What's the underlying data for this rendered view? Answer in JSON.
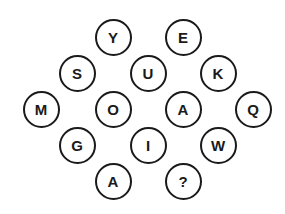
{
  "puzzle": {
    "cells": [
      {
        "label": "Y",
        "x": 113,
        "y": 37
      },
      {
        "label": "E",
        "x": 183,
        "y": 37
      },
      {
        "label": "S",
        "x": 77,
        "y": 73
      },
      {
        "label": "U",
        "x": 148,
        "y": 73
      },
      {
        "label": "K",
        "x": 218,
        "y": 73
      },
      {
        "label": "M",
        "x": 41,
        "y": 109
      },
      {
        "label": "O",
        "x": 113,
        "y": 109
      },
      {
        "label": "A",
        "x": 183,
        "y": 109
      },
      {
        "label": "Q",
        "x": 253,
        "y": 109
      },
      {
        "label": "G",
        "x": 77,
        "y": 145
      },
      {
        "label": "I",
        "x": 148,
        "y": 145
      },
      {
        "label": "W",
        "x": 218,
        "y": 145
      },
      {
        "label": "A",
        "x": 113,
        "y": 181
      },
      {
        "label": "?",
        "x": 183,
        "y": 181
      }
    ]
  }
}
